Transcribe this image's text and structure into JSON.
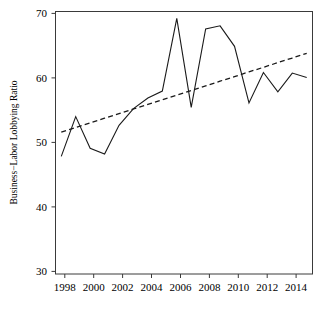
{
  "chart_data": {
    "type": "line",
    "title": "",
    "xlabel": "",
    "ylabel": "Business−Labor Lobbying Ratio",
    "xlim": [
      1997.6,
      2015.4
    ],
    "ylim": [
      29.0,
      71.2
    ],
    "grid": false,
    "legend": "none",
    "x_ticks": [
      1998,
      2000,
      2002,
      2004,
      2006,
      2008,
      2010,
      2012,
      2014
    ],
    "x_tick_labels": [
      "1998",
      "2000",
      "2002",
      "2004",
      "2006",
      "2008",
      "2010",
      "2012",
      "2014"
    ],
    "y_ticks": [
      30,
      40,
      50,
      60,
      70
    ],
    "y_tick_labels": [
      "30",
      "40",
      "50",
      "60",
      "70"
    ],
    "x": [
      1998,
      1999,
      2000,
      2001,
      2002,
      2003,
      2004,
      2005,
      2006,
      2007,
      2008,
      2009,
      2010,
      2011,
      2012,
      2013,
      2014,
      2015
    ],
    "series": [
      {
        "name": "Business-Labor Lobbying Ratio",
        "style": "solid",
        "color": "#1a1a1a",
        "values": [
          47.9,
          54.3,
          49.2,
          48.3,
          52.9,
          55.6,
          57.3,
          58.4,
          70.1,
          55.8,
          68.4,
          68.9,
          65.6,
          56.5,
          61.4,
          58.3,
          61.3,
          60.6
        ]
      },
      {
        "name": "Linear trend",
        "style": "dashed",
        "color": "#1a1a1a",
        "values": [
          51.8,
          52.55,
          53.29,
          54.04,
          54.78,
          55.53,
          56.27,
          57.02,
          57.76,
          58.51,
          59.25,
          60.0,
          60.74,
          61.49,
          62.23,
          62.98,
          63.72,
          64.47
        ]
      }
    ]
  },
  "figure": {
    "background_color": "#ffffff",
    "axis_color": "#3a3a3a",
    "line_color": "#1a1a1a"
  }
}
